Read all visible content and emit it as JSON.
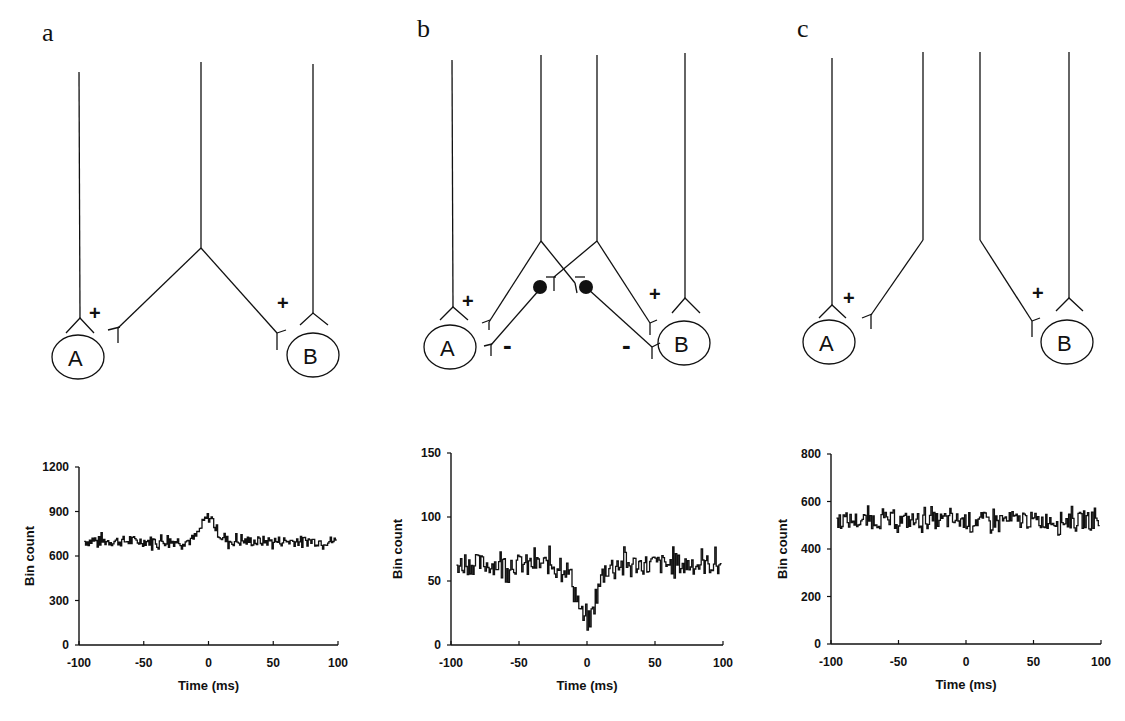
{
  "panels": [
    {
      "letter": "a",
      "diagram": {
        "cells": [
          "A",
          "B"
        ],
        "synapse_signs": {
          "A": "+",
          "B": "+"
        },
        "description": "Shared common excitatory input: one neuron branches to excite both A and B"
      }
    },
    {
      "letter": "b",
      "diagram": {
        "cells": [
          "A",
          "B"
        ],
        "synapse_signs": {
          "A_excitatory": "+",
          "B_excitatory": "+",
          "A_inhibitory": "-",
          "B_inhibitory": "-"
        },
        "description": "Two input neurons each excite one cell and, via an interneuron (filled circle), inhibit the other"
      }
    },
    {
      "letter": "c",
      "diagram": {
        "cells": [
          "A",
          "B"
        ],
        "synapse_signs": {
          "A": "+",
          "B": "+"
        },
        "description": "Independent excitatory inputs to A and B, no shared connection"
      }
    }
  ],
  "chart_data": [
    {
      "type": "line",
      "panel": "a",
      "title": "",
      "xlabel": "Time (ms)",
      "ylabel": "Bin count",
      "xlim": [
        -100,
        100
      ],
      "ylim": [
        0,
        1200
      ],
      "xticks": [
        "-100",
        "-50",
        "0",
        "50",
        "100"
      ],
      "yticks": [
        "0",
        "300",
        "600",
        "900",
        "1200"
      ],
      "grid": false,
      "series": [
        {
          "name": "cross-correlogram",
          "baseline": 700,
          "noise": 35,
          "feature": "peak",
          "feature_value": 860,
          "feature_time": 0,
          "feature_width": 8
        }
      ]
    },
    {
      "type": "line",
      "panel": "b",
      "title": "",
      "xlabel": "Time (ms)",
      "ylabel": "Bin count",
      "xlim": [
        -100,
        100
      ],
      "ylim": [
        0,
        150
      ],
      "xticks": [
        "-100",
        "-50",
        "0",
        "50",
        "100"
      ],
      "yticks": [
        "0",
        "50",
        "100",
        "150"
      ],
      "grid": false,
      "series": [
        {
          "name": "cross-correlogram",
          "baseline": 63,
          "noise": 8,
          "feature": "trough",
          "feature_value": 18,
          "feature_time": 0,
          "feature_width": 10
        }
      ]
    },
    {
      "type": "line",
      "panel": "c",
      "title": "",
      "xlabel": "Time (ms)",
      "ylabel": "Bin count",
      "xlim": [
        -100,
        100
      ],
      "ylim": [
        0,
        800
      ],
      "xticks": [
        "-100",
        "-50",
        "0",
        "50",
        "100"
      ],
      "yticks": [
        "0",
        "200",
        "400",
        "600",
        "800"
      ],
      "grid": false,
      "series": [
        {
          "name": "cross-correlogram",
          "baseline": 520,
          "noise": 35,
          "feature": "flat",
          "feature_value": 520,
          "feature_time": 0,
          "feature_width": 0
        }
      ]
    }
  ]
}
